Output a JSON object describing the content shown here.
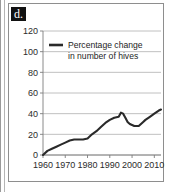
{
  "figure": {
    "panel_letter": "d.",
    "accent_color": "#2a2a2a",
    "grid_color": "#b9b9b9",
    "axis_color": "#7d7d7d"
  },
  "chart_data": {
    "type": "line",
    "title": "",
    "subtitle": "",
    "xlabel": "",
    "ylabel": "",
    "grid": "horizontal",
    "legend_position": "top-left-inside",
    "xlim": [
      1960,
      2013
    ],
    "ylim": [
      0,
      120
    ],
    "xticks": [
      1960,
      1970,
      1980,
      1990,
      2000,
      2010
    ],
    "xtick_labels": [
      "1960",
      "1970",
      "1980",
      "1990",
      "2000",
      "2010"
    ],
    "yticks": [
      0,
      20,
      40,
      60,
      80,
      100,
      120
    ],
    "ytick_labels": [
      "0",
      "20",
      "40",
      "60",
      "80",
      "100",
      "120"
    ],
    "series": [
      {
        "name": "Percentage change in number of hives",
        "legend_line_1": "Percentage change",
        "legend_line_2": "in number of hives",
        "color": "#2a2a2a",
        "x": [
          1960,
          1962,
          1964,
          1966,
          1968,
          1970,
          1972,
          1974,
          1976,
          1978,
          1980,
          1982,
          1984,
          1986,
          1988,
          1990,
          1992,
          1994,
          1995,
          1996,
          1997,
          1998,
          1999,
          2000,
          2001,
          2002,
          2003,
          2004,
          2005,
          2006,
          2008,
          2010,
          2012,
          2013
        ],
        "values": [
          0,
          4,
          6,
          8,
          10,
          12,
          14,
          15,
          15,
          15,
          16,
          20,
          23,
          27,
          31,
          34,
          36,
          37,
          41,
          40,
          36,
          32,
          30,
          29,
          28,
          28,
          28,
          30,
          32,
          34,
          37,
          40,
          43,
          44
        ]
      }
    ]
  }
}
